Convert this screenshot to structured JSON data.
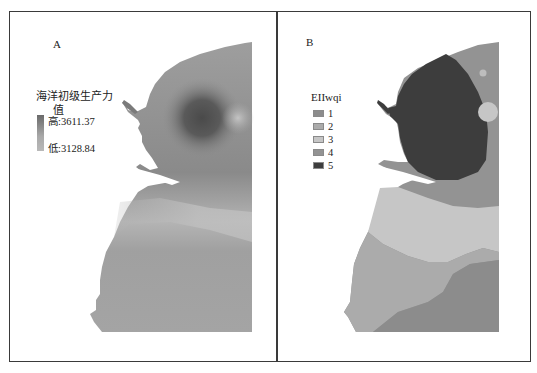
{
  "panels": {
    "a": {
      "label": "A",
      "legend": {
        "title_line1": "海洋初级生产力",
        "title_line2": "值",
        "high_label": "高:3611.37",
        "low_label": "低:3128.84",
        "ramp_colors": [
          "#6a6a6a",
          "#b9b9b9"
        ]
      }
    },
    "b": {
      "label": "B",
      "legend": {
        "title": "EIIwqi",
        "items": [
          {
            "label": "1",
            "color": "#8c8c8c"
          },
          {
            "label": "2",
            "color": "#ababab"
          },
          {
            "label": "3",
            "color": "#c6c6c6"
          },
          {
            "label": "4",
            "color": "#939393"
          },
          {
            "label": "5",
            "color": "#3d3d3d"
          }
        ]
      }
    }
  },
  "colors": {
    "frame": "#3a3a3a",
    "background": "#ffffff"
  }
}
